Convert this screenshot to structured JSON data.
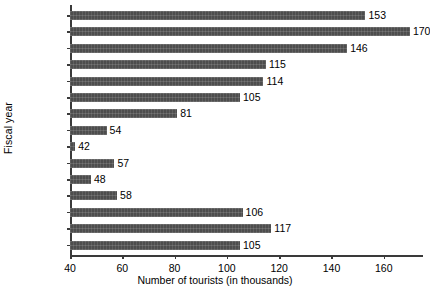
{
  "chart_data": {
    "type": "bar",
    "orientation": "horizontal",
    "title": "",
    "xlabel": "Number of tourists (in thousands)",
    "ylabel": "Fiscal year",
    "xlim": [
      40,
      175
    ],
    "xticks": [
      40,
      60,
      80,
      100,
      120,
      140,
      160
    ],
    "grid": false,
    "legend": null,
    "categories": [
      "2012/13",
      "2011/12",
      "2010/11",
      "2009/10",
      "2008/09",
      "2007/08",
      "2006/07",
      "2005/06",
      "2004/05",
      "2003/04",
      "2002/03",
      "2001/02",
      "2000/01",
      "1999/00",
      "1998/99"
    ],
    "values": [
      153,
      170,
      146,
      115,
      114,
      105,
      81,
      54,
      42,
      57,
      48,
      58,
      106,
      117,
      105
    ],
    "value_labels": [
      "153",
      "170",
      "146",
      "115",
      "114",
      "105",
      "81",
      "54",
      "42",
      "57",
      "48",
      "58",
      "106",
      "117",
      "105"
    ],
    "bar_color": "#4d4d4d",
    "axis_color": "#3a3a3a",
    "text_color": "#000000",
    "background": "#ffffff"
  }
}
